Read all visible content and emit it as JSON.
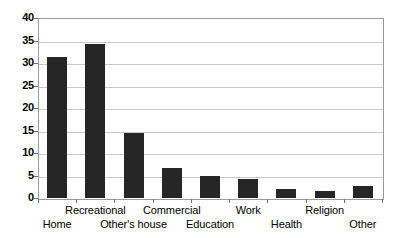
{
  "chart_data": {
    "type": "bar",
    "title": "",
    "subtitle": "",
    "xlabel": "",
    "ylabel": "",
    "categories": [
      "Home",
      "Recreational",
      "Other's house",
      "Commercial",
      "Education",
      "Work",
      "Health",
      "Religion",
      "Other"
    ],
    "values": [
      31.3,
      34.2,
      14.4,
      6.7,
      4.9,
      4.3,
      2.0,
      1.6,
      2.6
    ],
    "series": [
      {
        "name": "",
        "values": [
          31.3,
          34.2,
          14.4,
          6.7,
          4.9,
          4.3,
          2.0,
          1.6,
          2.6
        ]
      }
    ],
    "ylim": [
      0,
      40
    ],
    "ytick_labels": [
      "0",
      "5",
      "10",
      "15",
      "20",
      "25",
      "30",
      "35",
      "40"
    ],
    "ytick_values": [
      0,
      5,
      10,
      15,
      20,
      25,
      30,
      35,
      40
    ],
    "grid": true,
    "legend": false,
    "legend_position": "none",
    "bar_color": "#262626",
    "grid_color": "#c9c9c9",
    "axis_color": "#9a9a9a",
    "background_color": "#ffffff",
    "label_rows": [
      1,
      0,
      1,
      0,
      1,
      0,
      1,
      0,
      1
    ]
  }
}
